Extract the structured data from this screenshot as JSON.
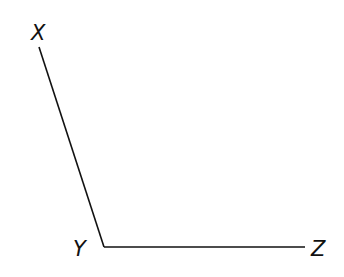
{
  "diagram": {
    "type": "angle",
    "points": [
      {
        "id": "X",
        "label": "X",
        "x": 39,
        "y": 47,
        "label_x": 31,
        "label_y": 40
      },
      {
        "id": "Y",
        "label": "Y",
        "x": 104,
        "y": 247,
        "label_x": 73,
        "label_y": 256
      },
      {
        "id": "Z",
        "label": "Z",
        "x": 305,
        "y": 247,
        "label_x": 311,
        "label_y": 256
      }
    ],
    "segments": [
      {
        "from": "X",
        "to": "Y"
      },
      {
        "from": "Y",
        "to": "Z"
      }
    ],
    "vertex": "Y",
    "line_color": "#111111",
    "background": "#ffffff"
  }
}
